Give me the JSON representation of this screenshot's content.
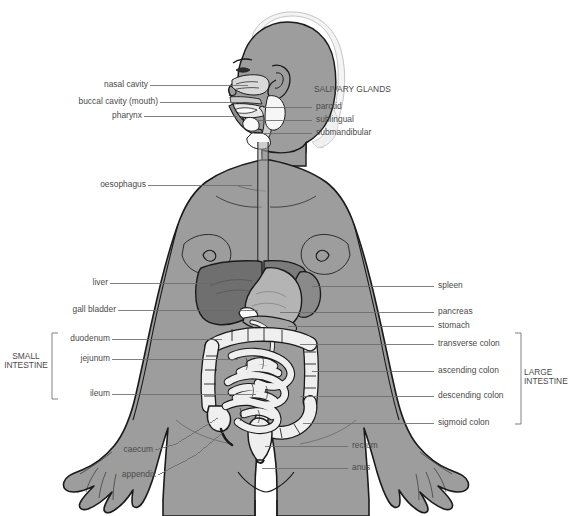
{
  "diagram": {
    "colors": {
      "background": "#ffffff",
      "body_fill": "#9d9d9d",
      "body_outline": "#1a1a1a",
      "hair_fill": "#f2f2f2",
      "liver_fill": "#6f6f6f",
      "stomach_fill": "#b4b4b4",
      "spleen_fill": "#8a8a8a",
      "intestine_fill": "#efefef",
      "organ_outline": "#1a1a1a",
      "leader_line": "#6b6b6b",
      "label_text": "#4a4a4a"
    },
    "labels_left": [
      {
        "id": "nasal-cavity",
        "text": "nasal cavity",
        "x": 88,
        "y": 80,
        "lead_to_x": 248,
        "lead_y": 85
      },
      {
        "id": "buccal-cavity",
        "text": "buccal cavity (mouth)",
        "x": 40,
        "y": 97,
        "lead_to_x": 243,
        "lead_y": 102
      },
      {
        "id": "pharynx",
        "text": "pharynx",
        "x": 104,
        "y": 111,
        "lead_to_x": 237,
        "lead_y": 116
      },
      {
        "id": "oesophagus",
        "text": "oesophagus",
        "x": 88,
        "y": 180,
        "lead_to_x": 252,
        "lead_y": 185
      },
      {
        "id": "liver",
        "text": "liver",
        "x": 91,
        "y": 278,
        "lead_to_x": 215,
        "lead_y": 283
      },
      {
        "id": "gall-bladder",
        "text": "gall bladder",
        "x": 55,
        "y": 305,
        "lead_to_x": 258,
        "lead_y": 310
      },
      {
        "id": "duodenum",
        "text": "duodenum",
        "x": 57,
        "y": 334,
        "lead_to_x": 222,
        "lead_y": 339
      },
      {
        "id": "jejunum",
        "text": "jejunum",
        "x": 68,
        "y": 354,
        "lead_to_x": 238,
        "lead_y": 359
      },
      {
        "id": "ileum",
        "text": "ileum",
        "x": 83,
        "y": 389,
        "lead_to_x": 256,
        "lead_y": 394
      },
      {
        "id": "caecum",
        "text": "caecum",
        "x": 118,
        "y": 448,
        "lead_to_x": 218,
        "lead_y": 418
      },
      {
        "id": "appendix",
        "text": "appendix",
        "x": 119,
        "y": 473,
        "lead_to_x": 224,
        "lead_y": 429
      }
    ],
    "labels_right": [
      {
        "id": "parotid",
        "text": "parotid",
        "x": 314,
        "y": 102,
        "lead_from_x": 263,
        "lead_y": 107
      },
      {
        "id": "sublingual",
        "text": "sublingual",
        "x": 314,
        "y": 115,
        "lead_from_x": 258,
        "lead_y": 120
      },
      {
        "id": "submandibular",
        "text": "submandibular",
        "x": 314,
        "y": 128,
        "lead_from_x": 254,
        "lead_y": 133
      },
      {
        "id": "spleen",
        "text": "spleen",
        "x": 437,
        "y": 281,
        "lead_from_x": 312,
        "lead_y": 286
      },
      {
        "id": "pancreas",
        "text": "pancreas",
        "x": 437,
        "y": 307,
        "lead_from_x": 280,
        "lead_y": 312
      },
      {
        "id": "stomach",
        "text": "stomach",
        "x": 437,
        "y": 321,
        "lead_from_x": 288,
        "lead_y": 326
      },
      {
        "id": "transverse-colon",
        "text": "transverse colon",
        "x": 437,
        "y": 339,
        "lead_from_x": 300,
        "lead_y": 344
      },
      {
        "id": "ascending-colon",
        "text": "ascending colon",
        "x": 437,
        "y": 366,
        "lead_from_x": 312,
        "lead_y": 371
      },
      {
        "id": "descending-colon",
        "text": "descending colon",
        "x": 437,
        "y": 391,
        "lead_from_x": 300,
        "lead_y": 396
      },
      {
        "id": "sigmoid-colon",
        "text": "sigmoid colon",
        "x": 437,
        "y": 418,
        "lead_from_x": 303,
        "lead_y": 423
      },
      {
        "id": "rectum",
        "text": "rectum",
        "x": 351,
        "y": 441,
        "lead_from_x": 265,
        "lead_y": 446
      },
      {
        "id": "anus",
        "text": "anus",
        "x": 351,
        "y": 463,
        "lead_from_x": 262,
        "lead_y": 468
      }
    ],
    "group_headings": {
      "salivary_glands": {
        "text": "SALIVARY GLANDS",
        "x": 314,
        "y": 88
      }
    },
    "brackets": [
      {
        "id": "small-intestine",
        "line1": "SMALL",
        "line2": "INTESTINE",
        "label_x": 8,
        "label_y": 356,
        "bracket_x": 52,
        "bracket_top": 333,
        "bracket_bottom": 399,
        "side": "left"
      },
      {
        "id": "large-intestine",
        "line1": "LARGE",
        "line2": "INTESTINE",
        "label_x": 528,
        "label_y": 372,
        "bracket_x": 521,
        "bracket_top": 333,
        "bracket_bottom": 424,
        "side": "right"
      }
    ]
  }
}
